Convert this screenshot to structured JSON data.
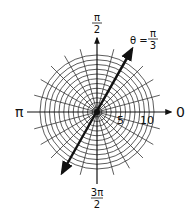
{
  "figure": {
    "type": "polar-coordinate-grid",
    "center": [
      97,
      112
    ],
    "circle_count": 12,
    "circle_spacing_px": 4.75,
    "spoke_step_degrees": 15,
    "colors": {
      "grid": "#333333",
      "axis": "#111111",
      "highlight_line": "#111111",
      "background": "#ffffff"
    }
  },
  "labels": {
    "angle_zero": "0",
    "angle_pi": "π",
    "angle_half_pi": {
      "numerator": "π",
      "denominator": "2"
    },
    "angle_three_half_pi": {
      "numerator": "3π",
      "denominator": "2"
    },
    "radius_5": "5",
    "radius_10": "10",
    "line_equation": {
      "lhs": "θ =",
      "numerator": "π",
      "denominator": "3"
    }
  },
  "highlight_line": {
    "theta": "π/3",
    "theta_degrees": 60,
    "arrows_both_ends": true
  }
}
